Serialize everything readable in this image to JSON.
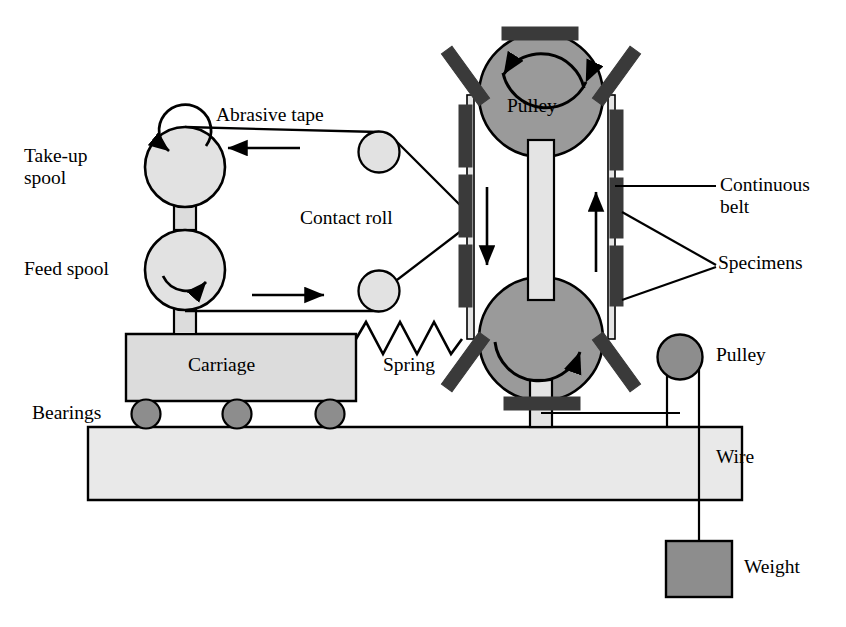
{
  "diagram": {
    "background": "#ffffff",
    "stroke": "#000000",
    "colors": {
      "pulley_fill": "#9a9a9a",
      "spool_fill": "#e2e2e2",
      "carriage_fill": "#dcdcdc",
      "base_fill": "#e9e9e9",
      "bearing_fill": "#8d8d8d",
      "specimen_fill": "#3a3a3a",
      "belt_fill": "#e4e4e4",
      "weight_fill": "#8d8d8d",
      "small_pulley_fill": "#8d8d8d"
    }
  },
  "labels": {
    "abrasive_tape": "Abrasive tape",
    "take_up_spool_line1": "Take-up",
    "take_up_spool_line2": "spool",
    "feed_spool": "Feed spool",
    "contact_roll": "Contact roll",
    "pulley_top": "Pulley",
    "pulley_right": "Pulley",
    "continuous_belt_line1": "Continuous",
    "continuous_belt_line2": "belt",
    "specimens": "Specimens",
    "carriage": "Carriage",
    "spring": "Spring",
    "bearings": "Bearings",
    "wire": "Wire",
    "weight": "Weight"
  },
  "parts": {
    "spools": [
      {
        "name": "take-up-spool",
        "cx": 185,
        "cy": 167,
        "r": 40,
        "rotation": "counter-clockwise"
      },
      {
        "name": "feed-spool",
        "cx": 185,
        "cy": 270,
        "r": 40,
        "rotation": "clockwise"
      }
    ],
    "idler_rollers": [
      {
        "name": "upper-idler-roller",
        "cx": 379,
        "cy": 152,
        "r": 20
      },
      {
        "name": "lower-idler-roller",
        "cx": 379,
        "cy": 291,
        "r": 20
      }
    ],
    "contact_roll": {
      "cx": 446,
      "cy": 218,
      "r": 22,
      "rotation": "clockwise"
    },
    "pulleys": [
      {
        "name": "top-pulley",
        "cx": 541,
        "cy": 95,
        "r": 62,
        "rotation": "clockwise"
      },
      {
        "name": "bottom-pulley",
        "cx": 541,
        "cy": 339,
        "r": 62,
        "rotation": "clockwise"
      },
      {
        "name": "wire-pulley",
        "cx": 680,
        "cy": 357,
        "r": 22
      }
    ],
    "bearings": [
      {
        "cx": 146,
        "cy": 414,
        "r": 14
      },
      {
        "cx": 237,
        "cy": 414,
        "r": 14
      },
      {
        "cx": 330,
        "cy": 414,
        "r": 14
      }
    ],
    "specimen_count": 14,
    "spring_peaks": 7,
    "weight": {
      "x": 666,
      "y": 541,
      "w": 66,
      "h": 56
    }
  },
  "flow_arrows": [
    {
      "name": "tape-top-arrow",
      "direction": "left"
    },
    {
      "name": "tape-bottom-arrow",
      "direction": "right"
    },
    {
      "name": "belt-left-arrow",
      "direction": "down"
    },
    {
      "name": "belt-right-arrow",
      "direction": "up"
    }
  ]
}
